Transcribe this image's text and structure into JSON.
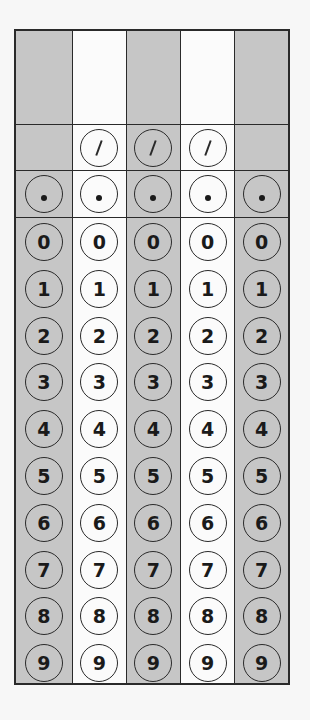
{
  "grid": {
    "columns": [
      {
        "index": 0,
        "shade": "shaded",
        "has_slash": false,
        "has_dot": true
      },
      {
        "index": 1,
        "shade": "white",
        "has_slash": true,
        "has_dot": true
      },
      {
        "index": 2,
        "shade": "shaded",
        "has_slash": true,
        "has_dot": true
      },
      {
        "index": 3,
        "shade": "white",
        "has_slash": true,
        "has_dot": true
      },
      {
        "index": 4,
        "shade": "shaded",
        "has_slash": false,
        "has_dot": true
      }
    ],
    "slash_symbol": "fraction-bar",
    "dot_symbol": "decimal-point",
    "digits": [
      "0",
      "1",
      "2",
      "3",
      "4",
      "5",
      "6",
      "7",
      "8",
      "9"
    ],
    "colors": {
      "shaded": "#c6c6c6",
      "white": "#fbfbfb",
      "line": "#2a2a2a"
    }
  }
}
